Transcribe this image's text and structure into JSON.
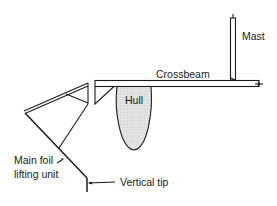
{
  "diagram": {
    "type": "hydrofoil trimaran cross-section",
    "labels": {
      "mast": "Mast",
      "crossbeam": "Crossbeam",
      "hull": "Hull",
      "main_foil_line1": "Main foil",
      "main_foil_line2": "lifting unit",
      "vertical_tip": "Vertical tip"
    },
    "colors": {
      "line": "#1a1a1a",
      "hull_fill": "#d9d9d9",
      "background": "#ffffff"
    }
  }
}
